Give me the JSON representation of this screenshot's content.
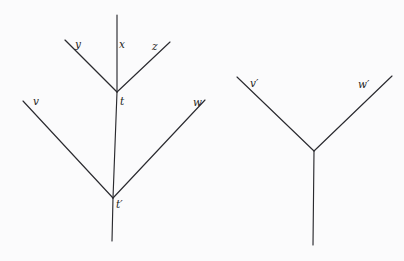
{
  "figure": {
    "kind": "tree-diagram",
    "background_color": "#fbfbfc",
    "line_color": "#2a2a2f",
    "label_color": "#1d1d22",
    "width": 404,
    "height": 261,
    "trees": [
      {
        "name": "left-tree",
        "labels": [
          {
            "key": "y",
            "text": "y",
            "x": 75,
            "y": 39
          },
          {
            "key": "x",
            "text": "x",
            "x": 119,
            "y": 39
          },
          {
            "key": "z",
            "text": "z",
            "x": 152,
            "y": 41
          },
          {
            "key": "t",
            "text": "t",
            "x": 120,
            "y": 96
          },
          {
            "key": "v",
            "text": "v",
            "x": 33,
            "y": 96
          },
          {
            "key": "w",
            "text": "w",
            "x": 193,
            "y": 97
          },
          {
            "key": "tp",
            "text": "t′",
            "x": 116,
            "y": 199
          }
        ],
        "edges": [
          {
            "key": "x-edge",
            "label": "x",
            "x1": 117,
            "y1": 15,
            "x2": 117,
            "y2": 92
          },
          {
            "key": "y-edge",
            "label": "y",
            "x1": 65,
            "y1": 40,
            "x2": 117,
            "y2": 92
          },
          {
            "key": "z-edge",
            "label": "z",
            "x1": 170,
            "y1": 42,
            "x2": 117,
            "y2": 92
          },
          {
            "key": "t-tp-edge",
            "label": "t–t′",
            "x1": 117,
            "y1": 92,
            "x2": 113,
            "y2": 198
          },
          {
            "key": "v-edge",
            "label": "v",
            "x1": 23,
            "y1": 101,
            "x2": 113,
            "y2": 198
          },
          {
            "key": "w-edge",
            "label": "w",
            "x1": 205,
            "y1": 100,
            "x2": 113,
            "y2": 198
          },
          {
            "key": "tp-stem",
            "label": "t′-stem",
            "x1": 113,
            "y1": 198,
            "x2": 112,
            "y2": 241
          }
        ]
      },
      {
        "name": "right-tree",
        "labels": [
          {
            "key": "vp",
            "text": "v′",
            "x": 250,
            "y": 78
          },
          {
            "key": "wp",
            "text": "w′",
            "x": 358,
            "y": 79
          }
        ],
        "edges": [
          {
            "key": "vp-edge",
            "label": "v′",
            "x1": 237,
            "y1": 77,
            "x2": 314,
            "y2": 151
          },
          {
            "key": "wp-edge",
            "label": "w′",
            "x1": 392,
            "y1": 76,
            "x2": 314,
            "y2": 151
          },
          {
            "key": "rp-stem",
            "label": "root-stem",
            "x1": 314,
            "y1": 151,
            "x2": 313,
            "y2": 245
          }
        ]
      }
    ]
  }
}
